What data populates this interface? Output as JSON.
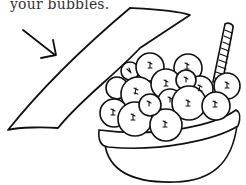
{
  "caption": {
    "text": "your bubbles."
  },
  "illustration": {
    "elements": [
      "arrow",
      "blank-banner",
      "bowl",
      "bubbles",
      "striped-straw"
    ],
    "colors": {
      "ink": "#111111",
      "background": "#ffffff",
      "caption": "#333333"
    }
  }
}
